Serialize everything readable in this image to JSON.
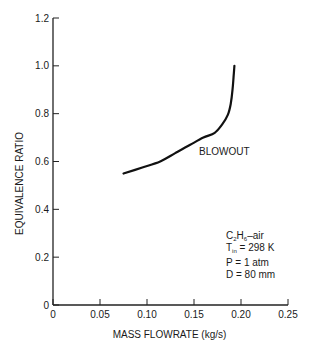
{
  "chart_data": {
    "type": "line",
    "title": "",
    "xlabel": "MASS FLOWRATE (kg/s)",
    "ylabel": "EQUIVALENCE RATIO",
    "xlim": [
      0,
      0.25
    ],
    "ylim": [
      0,
      1.2
    ],
    "x_ticks": [
      "0",
      "0.05",
      "0.10",
      "0.15",
      "0.20",
      "0.25"
    ],
    "y_ticks": [
      "0",
      "0.2",
      "0.4",
      "0.6",
      "0.8",
      "1.0",
      "1.2"
    ],
    "grid": false,
    "legend": null,
    "series": [
      {
        "name": "BLOWOUT",
        "x": [
          0.075,
          0.095,
          0.114,
          0.13,
          0.146,
          0.16,
          0.172,
          0.18,
          0.186,
          0.189,
          0.191,
          0.192,
          0.193
        ],
        "y": [
          0.55,
          0.575,
          0.6,
          0.635,
          0.67,
          0.7,
          0.72,
          0.755,
          0.795,
          0.84,
          0.9,
          0.95,
          1.0
        ]
      }
    ],
    "annotations": [
      {
        "text": "BLOWOUT",
        "x": 0.17,
        "y": 0.63
      },
      {
        "text": "C2H6–air",
        "x": 0.18,
        "y": 0.33
      },
      {
        "text": "Tin = 298 K",
        "x": 0.18,
        "y": 0.28
      },
      {
        "text": "P = 1 atm",
        "x": 0.18,
        "y": 0.23
      },
      {
        "text": "D = 80 mm",
        "x": 0.18,
        "y": 0.18
      }
    ]
  },
  "labels": {
    "curve_label": "BLOWOUT",
    "cond_fuel_a": "C",
    "cond_fuel_sub1": "2",
    "cond_fuel_b": "H",
    "cond_fuel_sub2": "6",
    "cond_fuel_c": "–air",
    "cond_t_a": "T",
    "cond_t_sub": "in",
    "cond_t_b": " = 298 K",
    "cond_p": "P = 1 atm",
    "cond_d": "D = 80 mm"
  },
  "colors": {
    "line": "#111111",
    "axis": "#222222"
  }
}
